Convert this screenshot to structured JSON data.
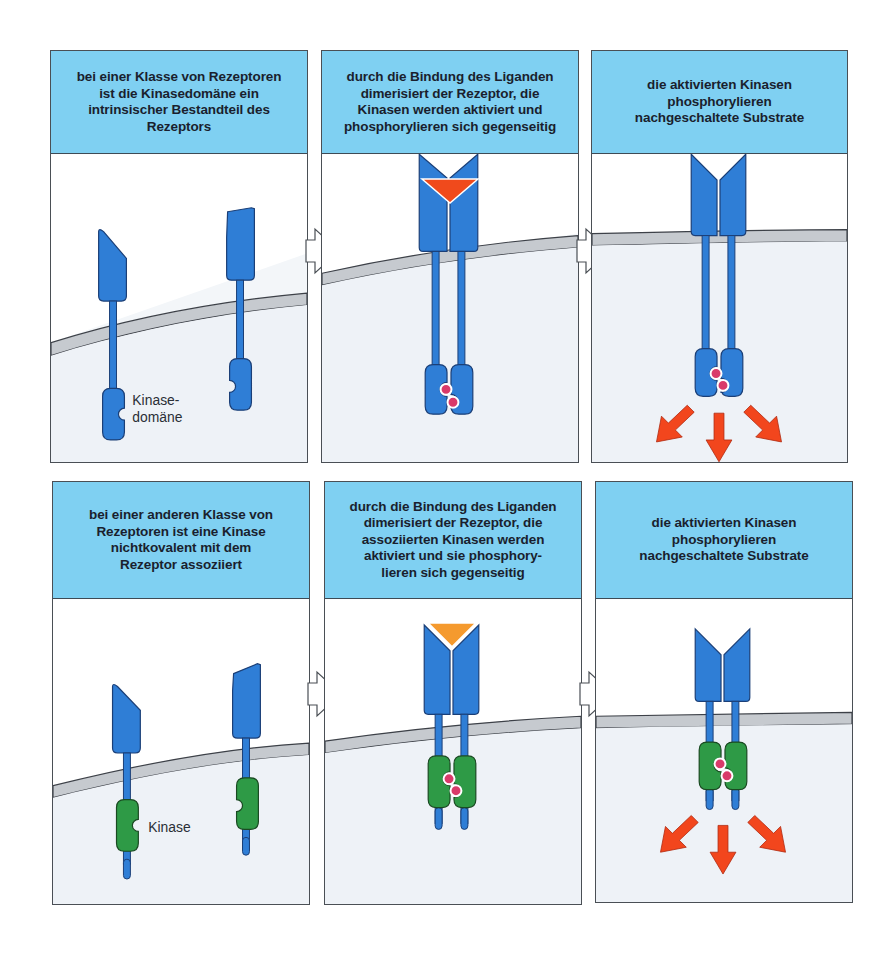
{
  "figure": {
    "colors": {
      "header_bg": "#7fd0f2",
      "receptor_blue": "#2f7ed6",
      "kinase_green": "#2e9a46",
      "ligand_red": "#f04a1c",
      "ligand_orange": "#f59a2e",
      "phosphate_pink": "#d93a6a",
      "membrane_gray": "#c6cacf",
      "cytoplasm": "#eef2f7",
      "signal_arrow_red": "#f2461d"
    },
    "rows": [
      {
        "name": "intrinsic-kinase-receptors",
        "panels": [
          {
            "header": "bei einer Klasse von Rezeptoren\nist die Kinasedomäne ein\nintrinsischer Bestandteil des\nRezeptors",
            "label": "Kinase-\ndomäne",
            "label_line1": "Kinase-",
            "label_line2": "domäne"
          },
          {
            "header": "durch die Bindung des Liganden\ndimerisiert der Rezeptor, die\nKinasen werden aktiviert und\nphosphorylieren sich gegenseitig"
          },
          {
            "header": "die aktivierten Kinasen\nphosphorylieren\nnachgeschaltete Substrate"
          }
        ]
      },
      {
        "name": "associated-kinase-receptors",
        "panels": [
          {
            "header": "bei einer anderen Klasse von\nRezeptoren ist eine Kinase\nnichtkovalent mit dem\nRezeptor assoziiert",
            "label": "Kinase"
          },
          {
            "header": "durch die Bindung des Liganden\ndimerisiert der Rezeptor, die\nassoziierten Kinasen werden\naktiviert und sie phosphory-\nlieren sich gegenseitig"
          },
          {
            "header": "die aktivierten Kinasen\nphosphorylieren\nnachgeschaltete Substrate"
          }
        ]
      }
    ]
  }
}
